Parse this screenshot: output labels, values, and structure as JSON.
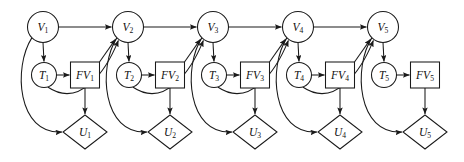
{
  "diagram": {
    "type": "influence-diagram",
    "canvas": {
      "width": 464,
      "height": 162,
      "background": "#ffffff"
    },
    "style": {
      "stroke_color": "#1a1a1a",
      "fill_color": "#ffffff",
      "stroke_width": 1.05,
      "label_style": "italic-serif-with-subscript"
    },
    "layout": {
      "slice_pitch": 85,
      "first_slice_x": 43,
      "chance_v_y": 27,
      "chance_v_radius": 15.5,
      "decision_t_offset_y": 75,
      "decision_t_radius": 12.5,
      "value_fv_x_offset": 43,
      "value_fv_y": 75,
      "value_fv_width": 29,
      "value_fv_height": 26,
      "utility_u_x_offset": 42,
      "utility_u_y": 132,
      "utility_u_half_width": 22,
      "utility_u_half_height": 17
    },
    "node_types": [
      {
        "key": "chance",
        "shape": "circle",
        "label": "V"
      },
      {
        "key": "test",
        "shape": "circle",
        "label": "T"
      },
      {
        "key": "decision",
        "shape": "rectangle",
        "label": "FV"
      },
      {
        "key": "utility",
        "shape": "diamond",
        "label": "U"
      }
    ],
    "slices": [
      {
        "index": 1,
        "v": {
          "id": "V1",
          "base": "V",
          "sub": "1",
          "shape": "circle",
          "cx": 43,
          "cy": 27
        },
        "t": {
          "id": "T1",
          "base": "T",
          "sub": "1",
          "shape": "circle",
          "cx": 44,
          "cy": 75
        },
        "fv": {
          "id": "FV1",
          "base": "FV",
          "sub": "1",
          "shape": "rectangle",
          "cx": 85,
          "cy": 75
        },
        "u": {
          "id": "U1",
          "base": "U",
          "sub": "1",
          "shape": "diamond",
          "cx": 85,
          "cy": 132
        }
      },
      {
        "index": 2,
        "v": {
          "id": "V2",
          "base": "V",
          "sub": "2",
          "shape": "circle",
          "cx": 128,
          "cy": 27
        },
        "t": {
          "id": "T2",
          "base": "T",
          "sub": "2",
          "shape": "circle",
          "cx": 129,
          "cy": 75
        },
        "fv": {
          "id": "FV2",
          "base": "FV",
          "sub": "2",
          "shape": "rectangle",
          "cx": 170,
          "cy": 75
        },
        "u": {
          "id": "U2",
          "base": "U",
          "sub": "2",
          "shape": "diamond",
          "cx": 170,
          "cy": 132
        }
      },
      {
        "index": 3,
        "v": {
          "id": "V3",
          "base": "V",
          "sub": "3",
          "shape": "circle",
          "cx": 213,
          "cy": 27
        },
        "t": {
          "id": "T3",
          "base": "T",
          "sub": "3",
          "shape": "circle",
          "cx": 214,
          "cy": 75
        },
        "fv": {
          "id": "FV3",
          "base": "FV",
          "sub": "3",
          "shape": "rectangle",
          "cx": 255,
          "cy": 75
        },
        "u": {
          "id": "U3",
          "base": "U",
          "sub": "3",
          "shape": "diamond",
          "cx": 255,
          "cy": 132
        }
      },
      {
        "index": 4,
        "v": {
          "id": "V4",
          "base": "V",
          "sub": "4",
          "shape": "circle",
          "cx": 298,
          "cy": 27
        },
        "t": {
          "id": "T4",
          "base": "T",
          "sub": "4",
          "shape": "circle",
          "cx": 299,
          "cy": 75
        },
        "fv": {
          "id": "FV4",
          "base": "FV",
          "sub": "4",
          "shape": "rectangle",
          "cx": 340,
          "cy": 75
        },
        "u": {
          "id": "U4",
          "base": "U",
          "sub": "4",
          "shape": "diamond",
          "cx": 340,
          "cy": 132
        }
      },
      {
        "index": 5,
        "v": {
          "id": "V5",
          "base": "V",
          "sub": "5",
          "shape": "circle",
          "cx": 383,
          "cy": 27
        },
        "t": {
          "id": "T5",
          "base": "T",
          "sub": "5",
          "shape": "circle",
          "cx": 384,
          "cy": 75
        },
        "fv": {
          "id": "FV5",
          "base": "FV",
          "sub": "5",
          "shape": "rectangle",
          "cx": 425,
          "cy": 75
        },
        "u": {
          "id": "U5",
          "base": "U",
          "sub": "5",
          "shape": "diamond",
          "cx": 425,
          "cy": 132
        }
      }
    ],
    "edges": [
      {
        "from": "V1",
        "to": "V2",
        "kind": "straight-horizontal"
      },
      {
        "from": "V2",
        "to": "V3",
        "kind": "straight-horizontal"
      },
      {
        "from": "V3",
        "to": "V4",
        "kind": "straight-horizontal"
      },
      {
        "from": "V4",
        "to": "V5",
        "kind": "straight-horizontal"
      },
      {
        "from": "V1",
        "to": "T1",
        "kind": "straight-vertical"
      },
      {
        "from": "V2",
        "to": "T2",
        "kind": "straight-vertical"
      },
      {
        "from": "V3",
        "to": "T3",
        "kind": "straight-vertical"
      },
      {
        "from": "V4",
        "to": "T4",
        "kind": "straight-vertical"
      },
      {
        "from": "V5",
        "to": "T5",
        "kind": "straight-vertical"
      },
      {
        "from": "T1",
        "to": "FV1",
        "kind": "straight-horizontal"
      },
      {
        "from": "T2",
        "to": "FV2",
        "kind": "straight-horizontal"
      },
      {
        "from": "T3",
        "to": "FV3",
        "kind": "straight-horizontal"
      },
      {
        "from": "T4",
        "to": "FV4",
        "kind": "straight-horizontal"
      },
      {
        "from": "T5",
        "to": "FV5",
        "kind": "straight-horizontal"
      },
      {
        "from": "FV1",
        "to": "U1",
        "kind": "straight-vertical"
      },
      {
        "from": "FV2",
        "to": "U2",
        "kind": "straight-vertical"
      },
      {
        "from": "FV3",
        "to": "U3",
        "kind": "straight-vertical"
      },
      {
        "from": "FV4",
        "to": "U4",
        "kind": "straight-vertical"
      },
      {
        "from": "FV5",
        "to": "U5",
        "kind": "straight-vertical"
      },
      {
        "from": "FV1",
        "to": "V2",
        "kind": "diagonal"
      },
      {
        "from": "FV2",
        "to": "V3",
        "kind": "diagonal"
      },
      {
        "from": "FV3",
        "to": "V4",
        "kind": "diagonal"
      },
      {
        "from": "FV4",
        "to": "V5",
        "kind": "diagonal"
      },
      {
        "from": "V1",
        "to": "U1",
        "kind": "curve-left-sweep"
      },
      {
        "from": "V2",
        "to": "U2",
        "kind": "curve-left-sweep"
      },
      {
        "from": "V3",
        "to": "U3",
        "kind": "curve-left-sweep"
      },
      {
        "from": "V4",
        "to": "U4",
        "kind": "curve-left-sweep"
      },
      {
        "from": "V5",
        "to": "U5",
        "kind": "curve-left-sweep"
      },
      {
        "from": "T1",
        "to": "V2",
        "kind": "curve-up-right"
      },
      {
        "from": "T2",
        "to": "V3",
        "kind": "curve-up-right"
      },
      {
        "from": "T3",
        "to": "V4",
        "kind": "curve-up-right"
      },
      {
        "from": "T4",
        "to": "V5",
        "kind": "curve-up-right"
      }
    ]
  }
}
